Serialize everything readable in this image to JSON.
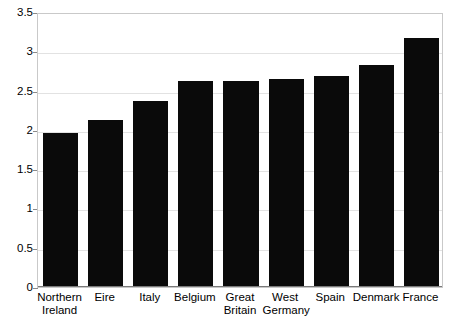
{
  "chart_data": {
    "type": "bar",
    "title": "",
    "subtitle": "",
    "xlabel": "",
    "ylabel": "",
    "categories": [
      "Northern Ireland",
      "Eire",
      "Italy",
      "Belgium",
      "Great Britain",
      "West Germany",
      "Spain",
      "Denmark",
      "France"
    ],
    "category_lines": [
      [
        "Northern",
        "Ireland"
      ],
      [
        "Eire"
      ],
      [
        "Italy"
      ],
      [
        "Belgium"
      ],
      [
        "Great",
        "Britain"
      ],
      [
        "West",
        "Germany"
      ],
      [
        "Spain"
      ],
      [
        "Denmark"
      ],
      [
        "France"
      ]
    ],
    "values": [
      1.96,
      2.12,
      2.37,
      2.62,
      2.62,
      2.65,
      2.68,
      2.83,
      3.17
    ],
    "ylim": [
      0,
      3.5
    ],
    "xlim": [
      0,
      9
    ],
    "yticks": [
      0,
      0.5,
      1,
      1.5,
      2,
      2.5,
      3,
      3.5
    ],
    "ytick_labels": [
      "0",
      "0.5",
      "1",
      "1.5",
      "2",
      "2.5",
      "3",
      "3.5"
    ],
    "grid": true,
    "grid_axis": "y",
    "legend": false,
    "legend_position": "none",
    "series": [
      {
        "name": "value",
        "values": [
          1.96,
          2.12,
          2.37,
          2.62,
          2.62,
          2.65,
          2.68,
          2.83,
          3.17
        ]
      }
    ],
    "colors": {
      "bar": "#0a0a0a",
      "grid": "#e2e2e2",
      "axis": "#8a8a8a",
      "frame": "#c9c9c9",
      "text": "#000000",
      "background": "#ffffff"
    },
    "bar_width_fraction": 0.78
  }
}
